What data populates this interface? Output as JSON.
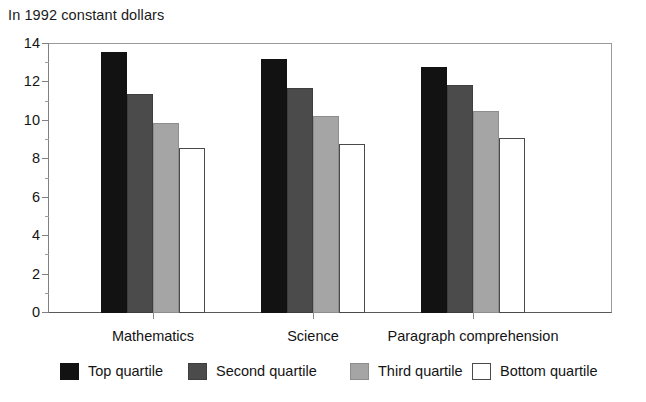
{
  "caption": "In 1992 constant dollars",
  "chart_data": {
    "type": "bar",
    "title": "In 1992 constant dollars",
    "xlabel": "",
    "ylabel": "",
    "ylim": [
      0,
      14
    ],
    "ytick_step": 2,
    "yticks": [
      "0",
      "2",
      "4",
      "6",
      "8",
      "10",
      "12",
      "14"
    ],
    "minor_yticks": [
      "1",
      "3",
      "5",
      "7",
      "9",
      "11",
      "13"
    ],
    "grid": false,
    "legend_position": "bottom",
    "categories": [
      "Mathematics",
      "Science",
      "Paragraph comprehension"
    ],
    "series": [
      {
        "name": "Top quartile",
        "color": "#121212",
        "values": [
          13.6,
          13.2,
          12.8
        ]
      },
      {
        "name": "Second quartile",
        "color": "#4b4b4b",
        "values": [
          11.4,
          11.7,
          11.85
        ]
      },
      {
        "name": "Third quartile",
        "color": "#a5a5a5",
        "values": [
          9.9,
          10.25,
          10.5
        ]
      },
      {
        "name": "Bottom quartile",
        "color": "#ffffff",
        "values": [
          8.6,
          8.8,
          9.1
        ]
      }
    ]
  }
}
